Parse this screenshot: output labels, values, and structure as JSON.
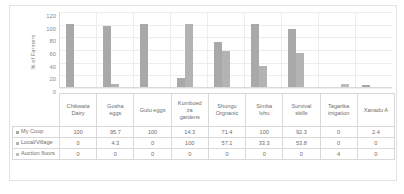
{
  "chart_data": {
    "type": "bar",
    "title": "",
    "xlabel": "",
    "ylabel": "% of Farmers",
    "ylim": [
      0,
      120
    ],
    "yticks": [
      120,
      100,
      80,
      60,
      40,
      20,
      0
    ],
    "grid": true,
    "legend_position": "table-row-labels",
    "categories": [
      "Chikwata Dairy",
      "Gosha eggs",
      "Gutu eggs",
      "Kumboedza gardens",
      "Shungu Organic",
      "Simba Ivhu",
      "Survival skills",
      "Tagarika irrigation",
      "Xanadu A"
    ],
    "series": [
      {
        "name": "My Coop",
        "values": [
          100,
          95.7,
          100,
          14.3,
          71.4,
          100,
          92.3,
          0,
          2.4
        ],
        "color": "#a9a9a9"
      },
      {
        "name": "Local/Village",
        "values": [
          0,
          4.3,
          0,
          100,
          57.1,
          33.3,
          53.8,
          0,
          0
        ],
        "color": "#b3b3b3"
      },
      {
        "name": "Auction floors",
        "values": [
          0,
          0,
          0,
          0,
          0,
          0,
          0,
          4,
          0
        ],
        "color": "#bdbdbd"
      }
    ]
  },
  "table": {
    "category_labels": [
      [
        "Chikwata",
        "Dairy"
      ],
      [
        "Gosha",
        "eggs"
      ],
      [
        "Gutu eggs"
      ],
      [
        "Kumboed",
        "za",
        "gardens"
      ],
      [
        "Shungu",
        "Orgnanic"
      ],
      [
        "Simba",
        "Ivhu"
      ],
      [
        "Survival",
        "skills"
      ],
      [
        "Tagarika",
        "irrigation"
      ],
      [
        "Xanadu A"
      ]
    ],
    "rows": [
      {
        "label": "My Coop",
        "cells": [
          "100",
          "95.7",
          "100",
          "14.3",
          "71.4",
          "100",
          "92.3",
          "0",
          "2.4"
        ]
      },
      {
        "label": "Local/Village",
        "cells": [
          "0",
          "4.3",
          "0",
          "100",
          "57.1",
          "33.3",
          "53.8",
          "0",
          "0"
        ]
      },
      {
        "label": "Auction floors",
        "cells": [
          "0",
          "0",
          "0",
          "0",
          "0",
          "0",
          "0",
          "4",
          "0"
        ]
      }
    ]
  },
  "axis": {
    "ylabel": "% of Farmers",
    "ticks": [
      "120",
      "100",
      "80",
      "60",
      "40",
      "20",
      "0"
    ]
  }
}
